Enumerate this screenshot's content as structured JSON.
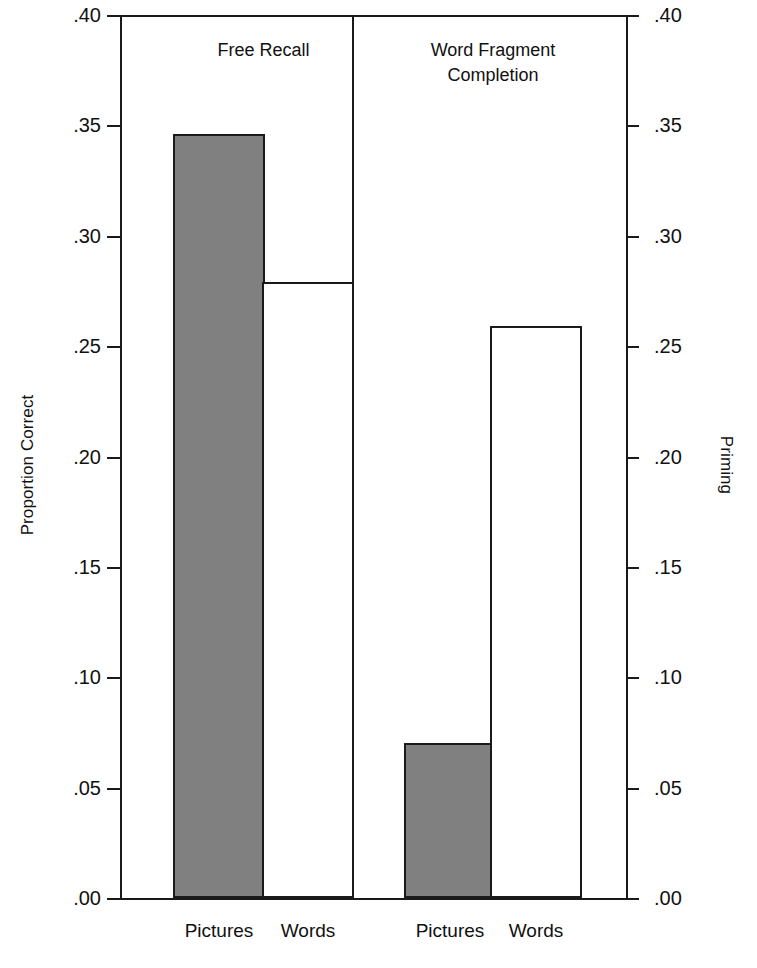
{
  "figure": {
    "background_color": "#ffffff",
    "axis_color": "#1a1a1a",
    "bar_fill_color": "#808080",
    "bar_empty_color": "#ffffff"
  },
  "axes": {
    "left_title": "Proportion Correct",
    "right_title": "Priming",
    "tick_labels": [
      ".40",
      ".35",
      ".30",
      ".25",
      ".20",
      ".15",
      ".10",
      ".05",
      ".00"
    ],
    "tick_values": [
      0.4,
      0.35,
      0.3,
      0.25,
      0.2,
      0.15,
      0.1,
      0.05,
      0.0
    ]
  },
  "groups": [
    {
      "title_line1": "Free Recall",
      "title_line2": ""
    },
    {
      "title_line1": "Word Fragment",
      "title_line2": "Completion"
    }
  ],
  "categories": [
    "Pictures",
    "Words",
    "Pictures",
    "Words"
  ],
  "chart_data": {
    "type": "bar",
    "title": "",
    "subtitle": "",
    "xlabel": "",
    "ylabel": "Proportion Correct",
    "y2label": "Priming",
    "ylim": [
      0.0,
      0.4
    ],
    "y2lim": [
      0.0,
      0.4
    ],
    "yticks": [
      0.0,
      0.05,
      0.1,
      0.15,
      0.2,
      0.25,
      0.3,
      0.35,
      0.4
    ],
    "ytick_labels": [
      ".00",
      ".05",
      ".10",
      ".15",
      ".20",
      ".25",
      ".30",
      ".35",
      ".40"
    ],
    "grid": false,
    "legend": "none",
    "panels": [
      {
        "name": "Free Recall",
        "axis": "left",
        "categories": [
          "Pictures",
          "Words"
        ],
        "values": [
          0.346,
          0.279
        ],
        "styles": [
          "filled",
          "hollow"
        ]
      },
      {
        "name": "Word Fragment Completion",
        "axis": "right",
        "categories": [
          "Pictures",
          "Words"
        ],
        "values": [
          0.07,
          0.259
        ],
        "styles": [
          "filled",
          "hollow"
        ]
      }
    ],
    "categories_all": [
      "Pictures",
      "Words",
      "Pictures",
      "Words"
    ],
    "values_all": [
      0.346,
      0.279,
      0.07,
      0.259
    ]
  }
}
